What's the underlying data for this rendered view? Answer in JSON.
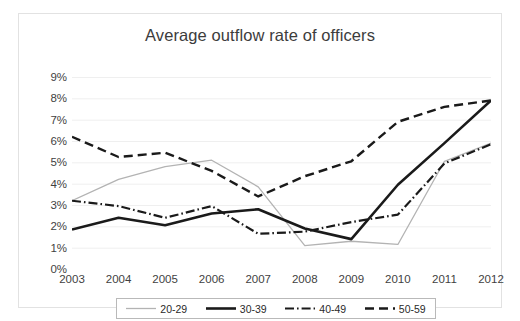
{
  "chart_data": {
    "type": "line",
    "title": "Average outflow rate of officers",
    "xlabel": "",
    "ylabel": "",
    "x": [
      "2003",
      "2004",
      "2005",
      "2006",
      "2007",
      "2008",
      "2009",
      "2010",
      "2011",
      "2012"
    ],
    "categories": [
      "2003",
      "2004",
      "2005",
      "2006",
      "2007",
      "2008",
      "2009",
      "2010",
      "2011",
      "2012"
    ],
    "ylim": [
      0,
      9
    ],
    "ytick_labels": [
      "9%",
      "8%",
      "7%",
      "6%",
      "5%",
      "4%",
      "3%",
      "2%",
      "1%",
      "0%"
    ],
    "ytick_values": [
      9,
      8,
      7,
      6,
      5,
      4,
      3,
      2,
      1,
      0
    ],
    "grid": true,
    "legend_position": "bottom",
    "series": [
      {
        "name": "20-29",
        "style": "solid-thin-light",
        "color": "#b3b3b3",
        "values": [
          3.2,
          4.2,
          4.8,
          5.1,
          3.85,
          1.1,
          1.3,
          1.15,
          5.05,
          5.9
        ]
      },
      {
        "name": "30-39",
        "style": "solid-thick-dark",
        "color": "#1a1a1a",
        "values": [
          1.85,
          2.4,
          2.05,
          2.6,
          2.8,
          1.9,
          1.4,
          3.95,
          5.9,
          7.9
        ]
      },
      {
        "name": "40-49",
        "style": "dash-dot",
        "color": "#1a1a1a",
        "values": [
          3.2,
          2.95,
          2.4,
          2.95,
          1.65,
          1.75,
          2.2,
          2.55,
          4.95,
          5.85
        ]
      },
      {
        "name": "50-59",
        "style": "dashed",
        "color": "#1a1a1a",
        "values": [
          6.2,
          5.25,
          5.45,
          4.6,
          3.4,
          4.35,
          5.05,
          6.9,
          7.6,
          7.9
        ]
      }
    ]
  },
  "legend": {
    "items": [
      {
        "label": "20-29",
        "icon": "line-thin-light-swatch"
      },
      {
        "label": "30-39",
        "icon": "line-thick-dark-swatch"
      },
      {
        "label": "40-49",
        "icon": "line-dash-dot-swatch"
      },
      {
        "label": "50-59",
        "icon": "line-dashed-swatch"
      }
    ]
  }
}
